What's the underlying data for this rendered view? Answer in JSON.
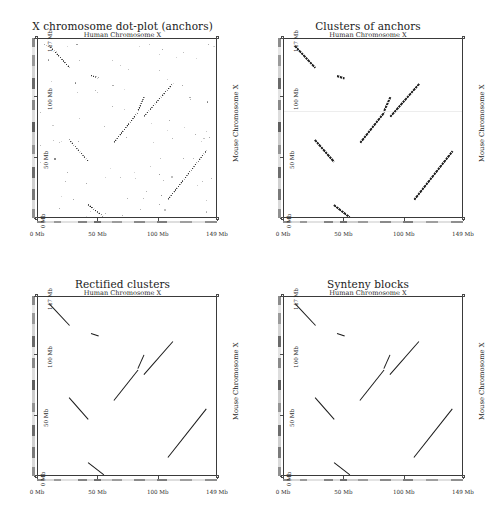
{
  "figure": {
    "width": 491,
    "height": 517,
    "background": "#ffffff",
    "ink": "#181818"
  },
  "axes_common": {
    "xlabel": "Human Chromosome X",
    "ylabel": "Mouse Chromosome X",
    "x_ticklabels": [
      "0 Mb",
      "50 Mb",
      "100 Mb",
      "149 Mb"
    ],
    "x_tickvalues": [
      0,
      50,
      100,
      149
    ],
    "y_ticklabels": [
      "0 Mb",
      "50 Mb",
      "100 Mb",
      "147 Mb"
    ],
    "y_tickvalues": [
      0,
      50,
      100,
      147
    ],
    "xlim": [
      0,
      149
    ],
    "ylim": [
      0,
      147
    ],
    "x_units": "Mb",
    "y_units": "Mb",
    "grid": false,
    "legend": "none"
  },
  "panels": [
    {
      "id": "anchors",
      "title": "X chromosome dot-plot (anchors)",
      "subtitle": "Human Chromosome X",
      "ylabel": "Mouse Chromosome X"
    },
    {
      "id": "clusters",
      "title": "Clusters of anchors",
      "subtitle": "Human Chromosome X",
      "ylabel": "Mouse Chromosome X"
    },
    {
      "id": "rectified",
      "title": "Rectified clusters",
      "subtitle": "Human Chromosome X",
      "ylabel": "Mouse Chromosome X"
    },
    {
      "id": "synteny",
      "title": "Synteny blocks",
      "subtitle": "Human Chromosome X",
      "ylabel": "Mouse Chromosome X"
    }
  ],
  "chart_data": {
    "type": "scatter",
    "xlabel": "Human Chromosome X",
    "ylabel": "Mouse Chromosome X",
    "xlim": [
      0,
      149
    ],
    "ylim": [
      0,
      147
    ],
    "x_ticks": [
      0,
      50,
      100,
      149
    ],
    "y_ticks": [
      0,
      50,
      100,
      147
    ],
    "grid": false,
    "legend": "none",
    "units": "Mb",
    "panel_layout": "2x2",
    "panels": [
      {
        "id": "anchors",
        "title": "X chromosome dot-plot (anchors)",
        "type": "scatter",
        "description": "Raw anchor matches: diagonal runs plus scattered noise points",
        "segments": [
          {
            "x1": 9,
            "y1": 142,
            "x2": 26,
            "y2": 124,
            "orientation": "reverse"
          },
          {
            "x1": 44,
            "y1": 118,
            "x2": 50,
            "y2": 116,
            "orientation": "reverse"
          },
          {
            "x1": 88,
            "y1": 84,
            "x2": 112,
            "y2": 111,
            "orientation": "forward"
          },
          {
            "x1": 83,
            "y1": 89,
            "x2": 88,
            "y2": 100,
            "orientation": "forward"
          },
          {
            "x1": 63,
            "y1": 63,
            "x2": 83,
            "y2": 88,
            "orientation": "forward"
          },
          {
            "x1": 26,
            "y1": 65,
            "x2": 42,
            "y2": 47,
            "orientation": "reverse"
          },
          {
            "x1": 108,
            "y1": 16,
            "x2": 140,
            "y2": 56,
            "orientation": "forward"
          },
          {
            "x1": 41,
            "y1": 12,
            "x2": 54,
            "y2": 2,
            "orientation": "reverse"
          }
        ],
        "noise_points": 95
      },
      {
        "id": "clusters",
        "title": "Clusters of anchors",
        "type": "scatter",
        "description": "Anchors grouped into clusters; noise removed",
        "segments": [
          {
            "x1": 9,
            "y1": 142,
            "x2": 26,
            "y2": 124,
            "orientation": "reverse"
          },
          {
            "x1": 44,
            "y1": 118,
            "x2": 50,
            "y2": 116,
            "orientation": "reverse"
          },
          {
            "x1": 88,
            "y1": 84,
            "x2": 112,
            "y2": 111,
            "orientation": "forward"
          },
          {
            "x1": 83,
            "y1": 89,
            "x2": 88,
            "y2": 100,
            "orientation": "forward"
          },
          {
            "x1": 63,
            "y1": 63,
            "x2": 83,
            "y2": 88,
            "orientation": "forward"
          },
          {
            "x1": 26,
            "y1": 65,
            "x2": 42,
            "y2": 47,
            "orientation": "reverse"
          },
          {
            "x1": 108,
            "y1": 16,
            "x2": 140,
            "y2": 56,
            "orientation": "forward"
          },
          {
            "x1": 41,
            "y1": 12,
            "x2": 54,
            "y2": 2,
            "orientation": "reverse"
          }
        ],
        "noise_points": 0
      },
      {
        "id": "rectified",
        "title": "Rectified clusters",
        "type": "scatter",
        "description": "Clusters replaced by straight rectified diagonals",
        "segments": [
          {
            "x1": 9,
            "y1": 142,
            "x2": 26,
            "y2": 124,
            "orientation": "reverse"
          },
          {
            "x1": 44,
            "y1": 118,
            "x2": 50,
            "y2": 116,
            "orientation": "reverse"
          },
          {
            "x1": 88,
            "y1": 84,
            "x2": 112,
            "y2": 111,
            "orientation": "forward"
          },
          {
            "x1": 83,
            "y1": 89,
            "x2": 88,
            "y2": 100,
            "orientation": "forward"
          },
          {
            "x1": 63,
            "y1": 63,
            "x2": 83,
            "y2": 88,
            "orientation": "forward"
          },
          {
            "x1": 26,
            "y1": 65,
            "x2": 42,
            "y2": 47,
            "orientation": "reverse"
          },
          {
            "x1": 108,
            "y1": 16,
            "x2": 140,
            "y2": 56,
            "orientation": "forward"
          },
          {
            "x1": 41,
            "y1": 12,
            "x2": 54,
            "y2": 2,
            "orientation": "reverse"
          }
        ],
        "noise_points": 0
      },
      {
        "id": "synteny",
        "title": "Synteny blocks",
        "type": "scatter",
        "description": "Final merged synteny blocks",
        "segments": [
          {
            "x1": 9,
            "y1": 142,
            "x2": 26,
            "y2": 124,
            "orientation": "reverse"
          },
          {
            "x1": 44,
            "y1": 118,
            "x2": 50,
            "y2": 116,
            "orientation": "reverse"
          },
          {
            "x1": 88,
            "y1": 84,
            "x2": 112,
            "y2": 111,
            "orientation": "forward"
          },
          {
            "x1": 83,
            "y1": 89,
            "x2": 88,
            "y2": 100,
            "orientation": "forward"
          },
          {
            "x1": 63,
            "y1": 63,
            "x2": 83,
            "y2": 88,
            "orientation": "forward"
          },
          {
            "x1": 26,
            "y1": 65,
            "x2": 42,
            "y2": 47,
            "orientation": "reverse"
          },
          {
            "x1": 108,
            "y1": 16,
            "x2": 140,
            "y2": 56,
            "orientation": "forward"
          },
          {
            "x1": 41,
            "y1": 12,
            "x2": 54,
            "y2": 2,
            "orientation": "reverse"
          }
        ],
        "noise_points": 0
      }
    ],
    "ideogram_x_bands": [
      {
        "start": 0,
        "end": 6,
        "shade": "#8d8d8d"
      },
      {
        "start": 6,
        "end": 14,
        "shade": "#d8d8d8"
      },
      {
        "start": 14,
        "end": 20,
        "shade": "#9a9a9a"
      },
      {
        "start": 20,
        "end": 34,
        "shade": "#e2e2e2"
      },
      {
        "start": 34,
        "end": 41,
        "shade": "#848484"
      },
      {
        "start": 41,
        "end": 47,
        "shade": "#dcdcdc"
      },
      {
        "start": 47,
        "end": 53,
        "shade": "#6f6f6f"
      },
      {
        "start": 53,
        "end": 62,
        "shade": "#cfcfcf"
      },
      {
        "start": 62,
        "end": 70,
        "shade": "#9c9c9c"
      },
      {
        "start": 70,
        "end": 80,
        "shade": "#e4e4e4"
      },
      {
        "start": 80,
        "end": 89,
        "shade": "#8a8a8a"
      },
      {
        "start": 89,
        "end": 99,
        "shade": "#d6d6d6"
      },
      {
        "start": 99,
        "end": 108,
        "shade": "#7d7d7d"
      },
      {
        "start": 108,
        "end": 118,
        "shade": "#dedede"
      },
      {
        "start": 118,
        "end": 128,
        "shade": "#9f9f9f"
      },
      {
        "start": 128,
        "end": 139,
        "shade": "#e0e0e0"
      },
      {
        "start": 139,
        "end": 149,
        "shade": "#8f8f8f"
      }
    ],
    "ideogram_y_bands": [
      {
        "start": 0,
        "end": 7,
        "shade": "#909090"
      },
      {
        "start": 7,
        "end": 15,
        "shade": "#dadada"
      },
      {
        "start": 15,
        "end": 24,
        "shade": "#7a7a7a"
      },
      {
        "start": 24,
        "end": 33,
        "shade": "#d0d0d0"
      },
      {
        "start": 33,
        "end": 42,
        "shade": "#6d6d6d"
      },
      {
        "start": 42,
        "end": 52,
        "shade": "#e0e0e0"
      },
      {
        "start": 52,
        "end": 60,
        "shade": "#949494"
      },
      {
        "start": 60,
        "end": 70,
        "shade": "#cccccc"
      },
      {
        "start": 70,
        "end": 78,
        "shade": "#5f5f5f"
      },
      {
        "start": 78,
        "end": 88,
        "shade": "#dddddd"
      },
      {
        "start": 88,
        "end": 96,
        "shade": "#8a8a8a"
      },
      {
        "start": 96,
        "end": 105,
        "shade": "#e3e3e3"
      },
      {
        "start": 105,
        "end": 114,
        "shade": "#6a6a6a"
      },
      {
        "start": 114,
        "end": 124,
        "shade": "#d4d4d4"
      },
      {
        "start": 124,
        "end": 133,
        "shade": "#9a9a9a"
      },
      {
        "start": 133,
        "end": 140,
        "shade": "#e6e6e6"
      },
      {
        "start": 140,
        "end": 147,
        "shade": "#8c8c8c"
      }
    ]
  }
}
